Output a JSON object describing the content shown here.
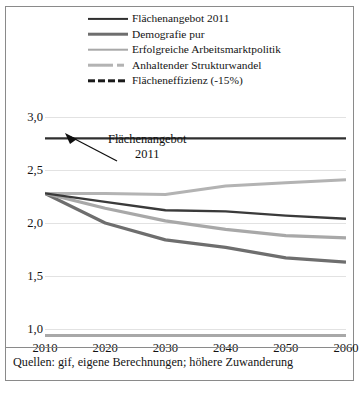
{
  "chart_data": {
    "type": "line",
    "title": "",
    "xlabel": "",
    "ylabel": "",
    "x": [
      2010,
      2020,
      2030,
      2040,
      2050,
      2060
    ],
    "xticklabels": [
      "2010",
      "2020",
      "2030",
      "2040",
      "2050",
      "2060"
    ],
    "yticklabels": [
      "3,0",
      "2,5",
      "2,0",
      "1,5",
      "1,0"
    ],
    "yticks": [
      3.0,
      2.5,
      2.0,
      1.5,
      1.0
    ],
    "ylim": [
      0.95,
      3.05
    ],
    "xlim": [
      2010,
      2060
    ],
    "grid": true,
    "legend_position": "top",
    "series": [
      {
        "name": "Flächenangebot 2011",
        "color": "#2f2f2f",
        "style": "solid",
        "width": 2.2,
        "values": [
          2.8,
          2.8,
          2.8,
          2.8,
          2.8,
          2.8
        ]
      },
      {
        "name": "Demografie pur",
        "color": "#6e6e6e",
        "style": "solid",
        "width": 3.2,
        "values": [
          2.28,
          2.0,
          1.84,
          1.77,
          1.67,
          1.63
        ]
      },
      {
        "name": "Erfolgreiche Arbeitsmarktpolitik",
        "color": "#a8a8a8",
        "style": "solid",
        "width": 3.2,
        "values": [
          2.28,
          2.14,
          2.02,
          1.94,
          1.88,
          1.86
        ]
      },
      {
        "name": "Anhaltender Strukturwandel",
        "color": "#b3b3b3",
        "style": "solid",
        "width": 3.0,
        "values": [
          2.28,
          2.28,
          2.27,
          2.35,
          2.38,
          2.41
        ]
      },
      {
        "name": "Flächeneffizienz (-15%)",
        "color": "#3a3a3a",
        "style": "solid-dark",
        "width": 2.4,
        "values": [
          2.28,
          2.2,
          2.12,
          2.11,
          2.07,
          2.04
        ]
      },
      {
        "name": "baseline",
        "color": "#a8a8a8",
        "style": "solid",
        "width": 2.6,
        "values": [
          1.0,
          1.0,
          1.0,
          1.0,
          1.0,
          1.0
        ]
      }
    ],
    "annotations": [
      {
        "text_line1": "Flächenangebot",
        "text_line2": "2011",
        "points_to_value": 2.8
      }
    ]
  },
  "legend": {
    "items": [
      {
        "label": "Flächenangebot 2011",
        "swatch": "line-dark-thin"
      },
      {
        "label": "Demografie pur",
        "swatch": "line-midgray"
      },
      {
        "label": "Erfolgreiche Arbeitsmarktpolitik",
        "swatch": "line-lightgray"
      },
      {
        "label": "Anhaltender Strukturwandel",
        "swatch": "line-lightgray-dashed"
      },
      {
        "label": "Flächeneffizienz (-15%)",
        "swatch": "line-black-dashed"
      }
    ]
  },
  "annotation": {
    "line1": "Flächenangebot",
    "line2": "2011"
  },
  "footer": {
    "source": "Quellen: gif, eigene Berechnungen; höhere Zuwanderung"
  }
}
